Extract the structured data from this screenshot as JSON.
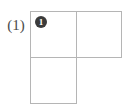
{
  "figure": {
    "label": "(1)",
    "background_color": "#ffffff",
    "grid_line_color": "#b5b5b5",
    "marker_fill_color": "#3b3b3b",
    "marker_text_color": "#ffffff",
    "label_color": "#4a4a4a"
  },
  "grid": {
    "rows": 2,
    "columns": 2,
    "cell_size_px": 46,
    "cells": [
      {
        "id": "cell-r0c0",
        "row": 0,
        "column": 0,
        "filled": true,
        "marker": "1"
      },
      {
        "id": "cell-r0c1",
        "row": 0,
        "column": 1,
        "filled": true,
        "marker": ""
      },
      {
        "id": "cell-r1c0",
        "row": 1,
        "column": 0,
        "filled": true,
        "marker": ""
      },
      {
        "id": "cell-r1c1",
        "row": 1,
        "column": 1,
        "filled": false,
        "marker": ""
      }
    ]
  }
}
